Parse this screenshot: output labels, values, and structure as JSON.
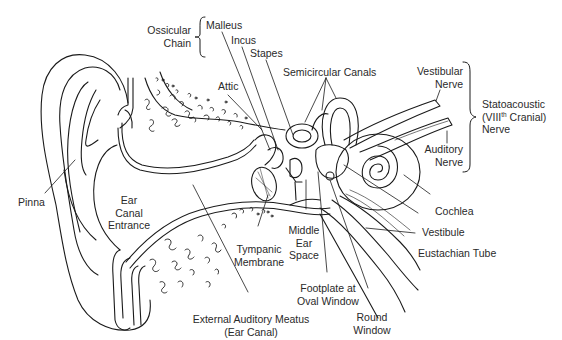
{
  "diagram": {
    "line_color": "#1a1a1a",
    "label_color": "#2a2a2a",
    "background": "#ffffff"
  },
  "labels": {
    "ossicular_chain": {
      "line1": "Ossicular",
      "line2": "Chain"
    },
    "malleus": "Malleus",
    "incus": "Incus",
    "stapes": "Stapes",
    "semicircular_canals": "Semicircular Canals",
    "attic": "Attic",
    "vestibular_nerve": {
      "line1": "Vestibular",
      "line2": "Nerve"
    },
    "statoacoustic_nerve": {
      "line1": "Statoacoustic",
      "line2_pre": "(VIII",
      "line2_sup": "th",
      "line2_post": " Cranial)",
      "line3": "Nerve"
    },
    "auditory_nerve": {
      "line1": "Auditory",
      "line2": "Nerve"
    },
    "pinna": "Pinna",
    "ear_canal_entrance": {
      "line1": "Ear",
      "line2": "Canal",
      "line3": "Entrance"
    },
    "cochlea": "Cochlea",
    "vestibule": "Vestibule",
    "eustachian_tube": "Eustachian Tube",
    "middle_ear_space": {
      "line1": "Middle",
      "line2": "Ear",
      "line3": "Space"
    },
    "tympanic_membrane": {
      "line1": "Tympanic",
      "line2": "Membrane"
    },
    "footplate_oval_window": {
      "line1": "Footplate at",
      "line2": "Oval Window"
    },
    "round_window": {
      "line1": "Round",
      "line2": "Window"
    },
    "external_auditory_meatus": {
      "line1": "External Auditory Meatus",
      "line2": "(Ear Canal)"
    }
  }
}
